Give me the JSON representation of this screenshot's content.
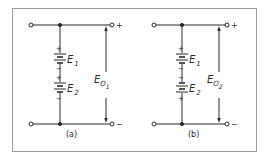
{
  "figure": {
    "frame_color": "#9a9a9a",
    "line_color": "#2a2a2a",
    "panels": [
      {
        "id": "a",
        "caption": "(a)",
        "battery1": {
          "name": "E",
          "sub": "1",
          "top_sign": "+",
          "bottom_sign": "−"
        },
        "battery2": {
          "name": "E",
          "sub": "2",
          "top_sign": "+",
          "bottom_sign": "−"
        },
        "output": {
          "name": "E",
          "sub": "O",
          "subsub": "1"
        },
        "terminal_top_sign": "+",
        "terminal_bottom_sign": "−"
      },
      {
        "id": "b",
        "caption": "(b)",
        "battery1": {
          "name": "E",
          "sub": "1",
          "top_sign": "+",
          "bottom_sign": "−"
        },
        "battery2": {
          "name": "E",
          "sub": "2",
          "top_sign": "−",
          "bottom_sign": "+"
        },
        "output": {
          "name": "E",
          "sub": "O",
          "subsub": "2"
        },
        "terminal_top_sign": "+",
        "terminal_bottom_sign": "−"
      }
    ]
  }
}
